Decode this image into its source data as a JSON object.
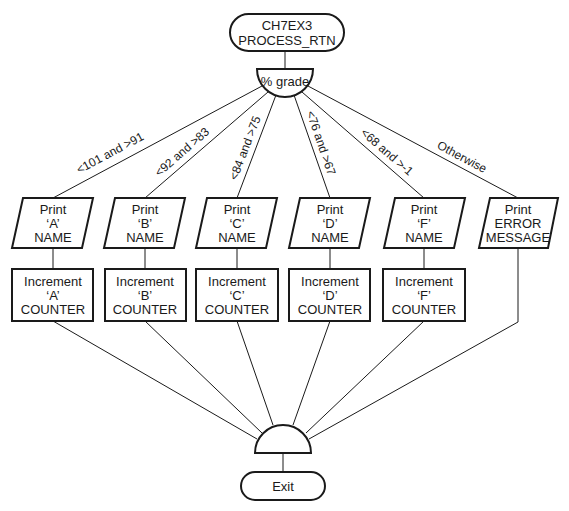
{
  "diagram": {
    "start": {
      "line1": "CH7EX3",
      "line2": "PROCESS_RTN"
    },
    "decision": {
      "label": "% grade"
    },
    "branches": [
      {
        "condition": "<101 and >91",
        "print": [
          "Print",
          "‘A’",
          "NAME"
        ],
        "process": [
          "Increment",
          "‘A’",
          "COUNTER"
        ]
      },
      {
        "condition": "<92 and >83",
        "print": [
          "Print",
          "‘B’",
          "NAME"
        ],
        "process": [
          "Increment",
          "‘B’",
          "COUNTER"
        ]
      },
      {
        "condition": "<84 and >75",
        "print": [
          "Print",
          "‘C’",
          "NAME"
        ],
        "process": [
          "Increment",
          "‘C’",
          "COUNTER"
        ]
      },
      {
        "condition": "<76 and >67",
        "print": [
          "Print",
          "‘D’",
          "NAME"
        ],
        "process": [
          "Increment",
          "‘D’",
          "COUNTER"
        ]
      },
      {
        "condition": "<68 and >-1",
        "print": [
          "Print",
          "‘F’",
          "NAME"
        ],
        "process": [
          "Increment",
          "‘F’",
          "COUNTER"
        ]
      },
      {
        "condition": "Otherwise",
        "print": [
          "Print",
          "ERROR",
          "MESSAGE"
        ]
      }
    ],
    "end": {
      "label": "Exit"
    },
    "colors": {
      "ink": "#1a1a1a",
      "background": "#ffffff"
    }
  }
}
